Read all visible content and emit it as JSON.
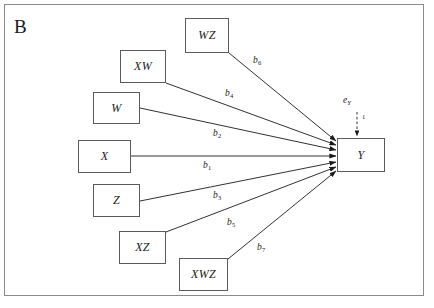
{
  "figure": {
    "panel_label": "B",
    "frame": {
      "x": 4,
      "y": 4,
      "width": 420,
      "height": 292,
      "border_color": "#8a8a8a"
    },
    "canvas": {
      "width": 434,
      "height": 308,
      "background": "#ffffff"
    },
    "ink_color": "#1a1a1a",
    "box_border_color": "#5a5a5a"
  },
  "nodes": [
    {
      "id": "WZ",
      "label": "WZ",
      "x": 185,
      "y": 18,
      "width": 44,
      "height": 35
    },
    {
      "id": "XW",
      "label": "XW",
      "x": 120,
      "y": 50,
      "width": 46,
      "height": 33
    },
    {
      "id": "W",
      "label": "W",
      "x": 93,
      "y": 92,
      "width": 47,
      "height": 32
    },
    {
      "id": "X",
      "label": "X",
      "x": 78,
      "y": 140,
      "width": 53,
      "height": 33
    },
    {
      "id": "Z",
      "label": "Z",
      "x": 93,
      "y": 184,
      "width": 47,
      "height": 33
    },
    {
      "id": "XZ",
      "label": "XZ",
      "x": 119,
      "y": 231,
      "width": 47,
      "height": 33
    },
    {
      "id": "XWZ",
      "label": "XWZ",
      "x": 179,
      "y": 258,
      "width": 49,
      "height": 33
    },
    {
      "id": "Y",
      "label": "Y",
      "x": 337,
      "y": 138,
      "width": 48,
      "height": 34
    }
  ],
  "paths": [
    {
      "id": "b6",
      "coef": "b",
      "sub": "6",
      "from": "WZ",
      "to": "Y",
      "x1": 229,
      "y1": 53,
      "x2": 336,
      "y2": 141,
      "label_x": 253,
      "label_y": 56
    },
    {
      "id": "b4",
      "coef": "b",
      "sub": "4",
      "from": "XW",
      "to": "Y",
      "x1": 166,
      "y1": 83,
      "x2": 336,
      "y2": 145,
      "label_x": 225,
      "label_y": 89
    },
    {
      "id": "b2",
      "coef": "b",
      "sub": "2",
      "from": "W",
      "to": "Y",
      "x1": 140,
      "y1": 108,
      "x2": 336,
      "y2": 150,
      "label_x": 213,
      "label_y": 129
    },
    {
      "id": "b1",
      "coef": "b",
      "sub": "1",
      "from": "X",
      "to": "Y",
      "x1": 131,
      "y1": 156,
      "x2": 336,
      "y2": 156,
      "label_x": 203,
      "label_y": 161
    },
    {
      "id": "b3",
      "coef": "b",
      "sub": "3",
      "from": "Z",
      "to": "Y",
      "x1": 140,
      "y1": 201,
      "x2": 336,
      "y2": 162,
      "label_x": 213,
      "label_y": 191
    },
    {
      "id": "b5",
      "coef": "b",
      "sub": "5",
      "from": "XZ",
      "to": "Y",
      "x1": 166,
      "y1": 232,
      "x2": 336,
      "y2": 167,
      "label_x": 227,
      "label_y": 218
    },
    {
      "id": "b7",
      "coef": "b",
      "sub": "7",
      "from": "XWZ",
      "to": "Y",
      "x1": 228,
      "y1": 259,
      "x2": 336,
      "y2": 171,
      "label_x": 257,
      "label_y": 243
    }
  ],
  "error_term": {
    "label": "e",
    "subscript": "Y",
    "label_x": 343,
    "label_y": 96,
    "unit_value": "1",
    "unit_x": 362,
    "unit_y": 114,
    "arrow": {
      "x1": 357,
      "y1": 112,
      "x2": 357,
      "y2": 136,
      "style": "dashed"
    }
  }
}
